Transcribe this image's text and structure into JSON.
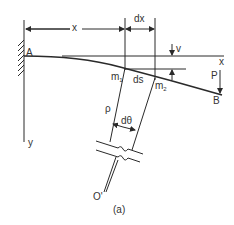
{
  "figure": {
    "caption": "(a)",
    "labels": {
      "A": "A",
      "B": "B",
      "x_dim": "x",
      "dx": "dx",
      "v": "v",
      "x_axis": "x",
      "y_axis": "y",
      "m1": "m",
      "m1_sub": "1",
      "m2": "m",
      "m2_sub": "2",
      "ds": "ds",
      "P": "P",
      "rho": "ρ",
      "dtheta": "dθ",
      "O": "O'"
    },
    "colors": {
      "line": "#2a2a2a",
      "text": "#333333"
    }
  }
}
